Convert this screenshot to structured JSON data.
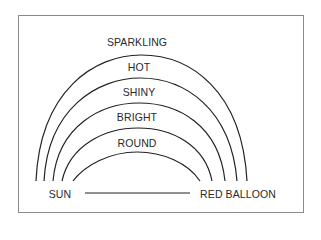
{
  "diagram": {
    "type": "nested arches word diagram",
    "arch_labels": [
      "SPARKLING",
      "HOT",
      "SHINY",
      "BRIGHT",
      "ROUND"
    ],
    "left_endpoint": "SUN",
    "right_endpoint": "RED BALLOON",
    "colors": {
      "stroke": "#222222",
      "border": "#8a8a8a",
      "text": "#2a2a2a",
      "background": "#ffffff"
    }
  }
}
